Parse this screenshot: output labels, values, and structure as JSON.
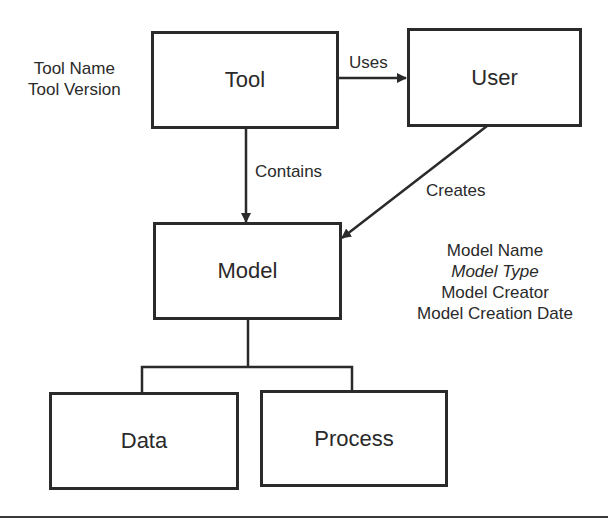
{
  "diagram": {
    "nodes": {
      "tool": {
        "label": "Tool"
      },
      "user": {
        "label": "User"
      },
      "model": {
        "label": "Model"
      },
      "data": {
        "label": "Data"
      },
      "process": {
        "label": "Process"
      }
    },
    "edges": {
      "uses": {
        "label": "Uses",
        "from": "Tool",
        "to": "User"
      },
      "contains": {
        "label": "Contains",
        "from": "Tool",
        "to": "Model"
      },
      "creates": {
        "label": "Creates",
        "from": "User",
        "to": "Model"
      }
    },
    "tool_attributes": [
      "Tool Name",
      "Tool Version"
    ],
    "model_attributes": [
      "Model Name",
      "Model Type",
      "Model Creator",
      "Model Creation Date"
    ],
    "colors": {
      "stroke": "#2a2a2a",
      "background": "#ffffff"
    }
  }
}
